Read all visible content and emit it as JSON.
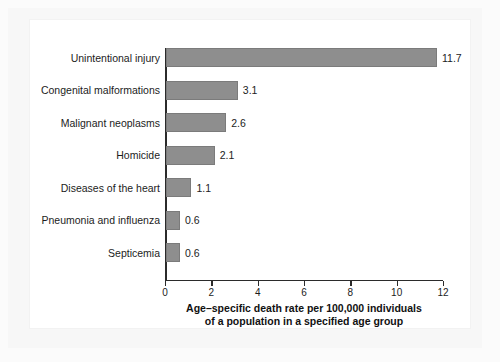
{
  "chart_data": {
    "type": "bar",
    "orientation": "horizontal",
    "title": "",
    "categories": [
      "Unintentional injury",
      "Congenital malformations",
      "Malignant neoplasms",
      "Homicide",
      "Diseases of the heart",
      "Pneumonia and influenza",
      "Septicemia"
    ],
    "values": [
      11.7,
      3.1,
      2.6,
      2.1,
      1.1,
      0.6,
      0.6
    ],
    "value_labels": [
      "11.7",
      "3.1",
      "2.6",
      "2.1",
      "1.1",
      "0.6",
      "0.6"
    ],
    "xlabel_line1": "Age–specific death rate per 100,000 individuals",
    "xlabel_line2": "of a population in a specified age group",
    "ylabel": "",
    "xlim": [
      0,
      12
    ],
    "xticks": [
      0,
      2,
      4,
      6,
      8,
      10,
      12
    ],
    "xtick_labels": [
      "0",
      "2",
      "4",
      "6",
      "8",
      "10",
      "12"
    ],
    "grid": false,
    "legend": false,
    "bar_color": "#8e8e8e",
    "axis_color": "#2b2b2b",
    "text_color": "#1c1c1c",
    "background_color": "#ffffff"
  }
}
